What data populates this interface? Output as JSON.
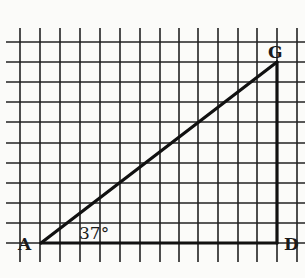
{
  "figure": {
    "type": "right-triangle-on-grid",
    "grid": {
      "x_lines": [
        20,
        40,
        60,
        80,
        100,
        120,
        140,
        160,
        179,
        198,
        218,
        238,
        257,
        277,
        297
      ],
      "y_lines": [
        42,
        62,
        82,
        102,
        122,
        143,
        163,
        183,
        203,
        223,
        243
      ],
      "x_top": 28,
      "x_bottom": 262,
      "y_left": 6,
      "y_right": 305,
      "color": "#222222"
    },
    "vertices": {
      "A": {
        "x": 41,
        "y": 243,
        "label": "A"
      },
      "G": {
        "x": 277,
        "y": 62,
        "label": "G"
      },
      "D": {
        "x": 277,
        "y": 243,
        "label": "D"
      }
    },
    "angle_label": "37°",
    "line_color": "#111111",
    "background": "#fbfbf9"
  }
}
